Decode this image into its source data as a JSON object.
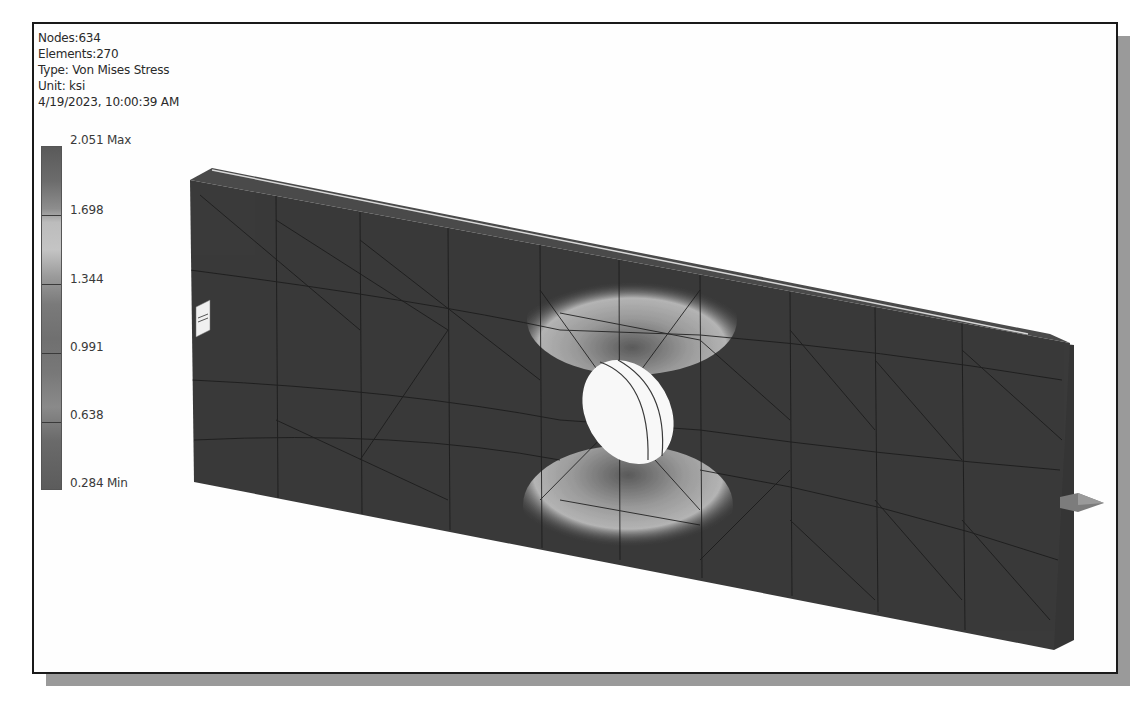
{
  "info": {
    "nodes": "Nodes:634",
    "elements": "Elements:270",
    "type": "Type: Von Mises Stress",
    "unit": "Unit: ksi",
    "timestamp": "4/19/2023, 10:00:39 AM"
  },
  "legend": {
    "title": "Von Mises Stress (ksi)",
    "labels": [
      {
        "text": "2.051 Max",
        "value": 2.051
      },
      {
        "text": "1.698",
        "value": 1.698
      },
      {
        "text": "1.344",
        "value": 1.344
      },
      {
        "text": "0.991",
        "value": 0.991
      },
      {
        "text": "0.638",
        "value": 0.638
      },
      {
        "text": "0.284 Min",
        "value": 0.284
      }
    ]
  },
  "model": {
    "description": "Plate with central hole under tension, FEA stress result",
    "constraint_icon": "fixed-constraint-icon",
    "load_icon": "force-arrow-icon",
    "colors": {
      "plate": "#3a3a3a",
      "mesh": "#1c1c1c",
      "hole": "#f8f8f8",
      "stress_high": "#bdbdbd",
      "arrow": "#7c7c7c"
    }
  }
}
